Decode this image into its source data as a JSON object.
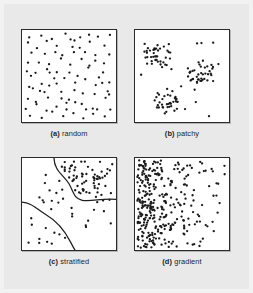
{
  "figure": {
    "background_color": "#e9e9e9",
    "panel_background_color": "#ffffff",
    "panel_border_color": "#2b2b2b",
    "dot_color": "#1a1a1a",
    "panels": [
      {
        "id": "a",
        "tag": "(a)",
        "label": "random"
      },
      {
        "id": "b",
        "tag": "(b)",
        "label": "patchy"
      },
      {
        "id": "c",
        "tag": "(c)",
        "label": "stratified"
      },
      {
        "id": "d",
        "tag": "(d)",
        "label": "gradient"
      }
    ]
  },
  "chart_data": {
    "type": "scatter",
    "title": "",
    "xlabel": "",
    "ylabel": "",
    "xlim": [
      0,
      100
    ],
    "ylim": [
      0,
      100
    ],
    "grid": false,
    "legend": "none",
    "panel_layout": "2x2",
    "annotations": [
      "(a) random",
      "(b) patchy",
      "(c) stratified",
      "(d) gradient"
    ],
    "panels": [
      {
        "id": "a",
        "tag": "(a)",
        "label": "random",
        "distribution": "uniform random",
        "n_points": 92,
        "points": [
          [
            9,
            6
          ],
          [
            20,
            4
          ],
          [
            34,
            8
          ],
          [
            47,
            3
          ],
          [
            58,
            9
          ],
          [
            69,
            5
          ],
          [
            81,
            7
          ],
          [
            93,
            4
          ],
          [
            5,
            14
          ],
          [
            16,
            18
          ],
          [
            27,
            12
          ],
          [
            39,
            16
          ],
          [
            50,
            11
          ],
          [
            63,
            17
          ],
          [
            74,
            13
          ],
          [
            88,
            19
          ],
          [
            12,
            24
          ],
          [
            23,
            28
          ],
          [
            35,
            22
          ],
          [
            44,
            27
          ],
          [
            56,
            25
          ],
          [
            67,
            23
          ],
          [
            79,
            29
          ],
          [
            91,
            26
          ],
          [
            7,
            33
          ],
          [
            18,
            37
          ],
          [
            30,
            35
          ],
          [
            41,
            31
          ],
          [
            53,
            38
          ],
          [
            65,
            34
          ],
          [
            77,
            32
          ],
          [
            89,
            36
          ],
          [
            4,
            43
          ],
          [
            15,
            47
          ],
          [
            26,
            41
          ],
          [
            37,
            46
          ],
          [
            49,
            44
          ],
          [
            60,
            48
          ],
          [
            72,
            42
          ],
          [
            84,
            45
          ],
          [
            11,
            52
          ],
          [
            22,
            57
          ],
          [
            33,
            54
          ],
          [
            45,
            51
          ],
          [
            57,
            58
          ],
          [
            68,
            55
          ],
          [
            80,
            53
          ],
          [
            92,
            56
          ],
          [
            8,
            63
          ],
          [
            19,
            67
          ],
          [
            31,
            61
          ],
          [
            42,
            66
          ],
          [
            54,
            64
          ],
          [
            66,
            68
          ],
          [
            78,
            62
          ],
          [
            90,
            65
          ],
          [
            6,
            73
          ],
          [
            17,
            77
          ],
          [
            28,
            71
          ],
          [
            40,
            76
          ],
          [
            51,
            74
          ],
          [
            62,
            78
          ],
          [
            75,
            72
          ],
          [
            87,
            75
          ],
          [
            13,
            82
          ],
          [
            24,
            86
          ],
          [
            36,
            83
          ],
          [
            48,
            88
          ],
          [
            59,
            81
          ],
          [
            70,
            85
          ],
          [
            82,
            87
          ],
          [
            94,
            84
          ],
          [
            10,
            93
          ],
          [
            21,
            96
          ],
          [
            32,
            91
          ],
          [
            43,
            95
          ],
          [
            55,
            92
          ],
          [
            64,
            97
          ],
          [
            76,
            93
          ],
          [
            86,
            96
          ],
          [
            29,
            48
          ],
          [
            52,
            19
          ],
          [
            71,
            39
          ],
          [
            38,
            59
          ],
          [
            61,
            9
          ],
          [
            14,
            62
          ],
          [
            85,
            57
          ],
          [
            46,
            79
          ],
          [
            25,
            69
          ],
          [
            73,
            84
          ],
          [
            95,
            71
          ],
          [
            3,
            88
          ]
        ]
      },
      {
        "id": "b",
        "tag": "(b)",
        "label": "patchy",
        "distribution": "clustered / patchy",
        "n_points": 128,
        "clusters": [
          {
            "center_x": 24,
            "center_y": 28,
            "radius": 15,
            "n": 38
          },
          {
            "center_x": 70,
            "center_y": 45,
            "radius": 15,
            "n": 38
          },
          {
            "center_x": 34,
            "center_y": 78,
            "radius": 14,
            "n": 36
          }
        ],
        "scattered_n": 16
      },
      {
        "id": "c",
        "tag": "(c)",
        "label": "stratified",
        "distribution": "stratified by boundary curves",
        "n_points": 106,
        "strata": [
          {
            "name": "high density stratum",
            "region": "upper-right",
            "relative_density": "high"
          },
          {
            "name": "medium density stratum",
            "region": "middle band",
            "relative_density": "low"
          },
          {
            "name": "low density stratum",
            "region": "lower-left",
            "relative_density": "very low"
          }
        ],
        "boundary_curves": 2
      },
      {
        "id": "d",
        "tag": "(d)",
        "label": "gradient",
        "distribution": "density gradient, decreasing left to right",
        "n_points": 330,
        "density_profile": {
          "x_percent": [
            0,
            20,
            40,
            60,
            80,
            100
          ],
          "relative_density": [
            1.0,
            0.62,
            0.33,
            0.18,
            0.1,
            0.06
          ]
        }
      }
    ]
  }
}
